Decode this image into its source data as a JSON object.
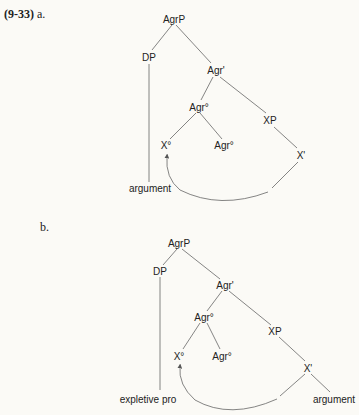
{
  "example_number": "(9-33)",
  "diagrams": [
    {
      "label": "a.",
      "nodes": {
        "agrp": "AgrP",
        "dp": "DP",
        "agr_bar": "Agr'",
        "agr0_upper": "Agr°",
        "xp": "XP",
        "x0": "X°",
        "agr0_lower": "Agr°",
        "x_bar": "X'",
        "leaf_dp": "argument"
      }
    },
    {
      "label": "b.",
      "nodes": {
        "agrp": "AgrP",
        "dp": "DP",
        "agr_bar": "Agr'",
        "agr0_upper": "Agr°",
        "xp": "XP",
        "x0": "X°",
        "agr0_lower": "Agr°",
        "x_bar": "X'",
        "leaf_dp": "expletive pro",
        "leaf_xbar": "argument"
      }
    }
  ],
  "colors": {
    "line": "#555555",
    "text": "#222222",
    "background": "#fbfaf6"
  }
}
